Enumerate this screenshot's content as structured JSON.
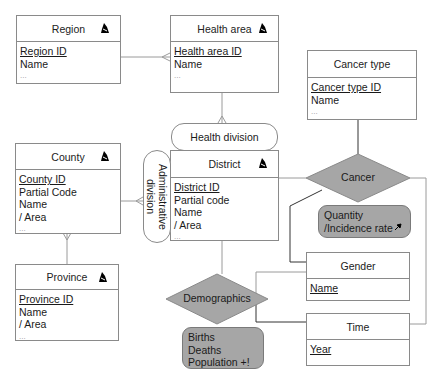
{
  "diagram": {
    "type": "entity-relationship",
    "colors": {
      "entity_border": "#8a8a8a",
      "relationship_fill": "#a6a6a6",
      "attribute_fill": "#a6a6a6",
      "line": "#9a9a9a",
      "line_dark": "#333333"
    },
    "entities": {
      "region": {
        "title": "Region",
        "has_icon": true,
        "fields": [
          "Region ID",
          "Name",
          "..."
        ],
        "primary_key": "Region ID"
      },
      "health_area": {
        "title": "Health area",
        "has_icon": true,
        "fields": [
          "Health area ID",
          "Name",
          "..."
        ],
        "primary_key": "Health area ID"
      },
      "cancer_type": {
        "title": "Cancer type",
        "has_icon": false,
        "fields": [
          "Cancer type ID",
          "Name",
          "..."
        ],
        "primary_key": "Cancer type ID"
      },
      "county": {
        "title": "County",
        "has_icon": true,
        "fields": [
          "County ID",
          "Partial Code",
          "Name",
          "/ Area",
          "..."
        ],
        "primary_key": "County ID"
      },
      "district": {
        "title": "District",
        "has_icon": true,
        "fields": [
          "District ID",
          "Partial code",
          "Name",
          "/ Area",
          "..."
        ],
        "primary_key": "District ID"
      },
      "province": {
        "title": "Province",
        "has_icon": true,
        "fields": [
          "Province ID",
          "Name",
          "/ Area",
          "..."
        ],
        "primary_key": "Province ID"
      },
      "gender": {
        "title": "Gender",
        "has_icon": false,
        "fields": [
          "Name"
        ],
        "primary_key": "Name"
      },
      "time": {
        "title": "Time",
        "has_icon": false,
        "fields": [
          "Year"
        ],
        "primary_key": "Year"
      }
    },
    "hierarchies": {
      "health_division": "Health division",
      "administrative_division": "Administrative division"
    },
    "relationships": {
      "cancer": {
        "label": "Cancer",
        "attributes": [
          "Quantity",
          "/Incidence rate"
        ]
      },
      "demographics": {
        "label": "Demographics",
        "attributes": [
          "Births",
          "Deaths",
          "Population +!"
        ]
      }
    }
  }
}
